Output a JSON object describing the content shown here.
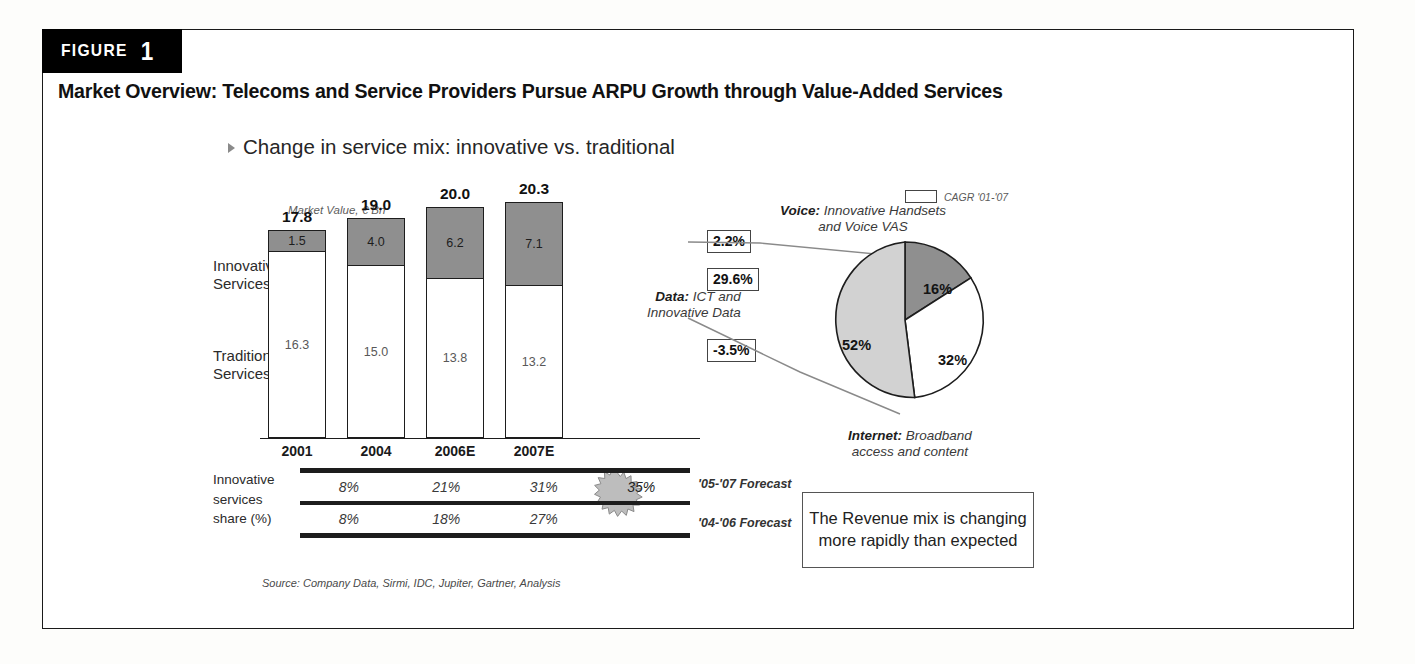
{
  "figure": {
    "tab_word": "FIGURE",
    "tab_number": "1",
    "heading": "Market Overview: Telecoms and Service Providers Pursue ARPU Growth through Value-Added Services",
    "subtitle": "Change in service mix: innovative vs. traditional",
    "source": "Source: Company Data, Sirmi, IDC, Jupiter, Gartner, Analysis"
  },
  "legend": {
    "cagr_label": "CAGR '01-'07",
    "swatch_icon": "rectangle-outline-icon"
  },
  "labels": {
    "axis_caption": "Market Value, € Bn",
    "innovative_services": "Innovative\nServices",
    "innovative_line1": "Innovative",
    "innovative_line2": "Services",
    "traditional_line1": "Traditional",
    "traditional_line2": "Services",
    "share_line1": "Innovative",
    "share_line2": "services",
    "share_line3": "share (%)",
    "forecast_top": "'05-'07 Forecast",
    "forecast_bottom": "'04-'06 Forecast"
  },
  "callout": {
    "text": "The Revenue mix is changing more rapidly than expected"
  },
  "annotations": {
    "voice_bold": "Voice:",
    "voice_rest": " Innovative Handsets",
    "voice_line2": "and Voice VAS",
    "data_bold": "Data:",
    "data_rest": " ICT and",
    "data_line2": "Innovative Data",
    "internet_bold": "Internet:",
    "internet_rest": " Broadband",
    "internet_line2": "access and content"
  },
  "colors": {
    "innovative_segment": "#8f8f8f",
    "traditional_segment": "#ffffff",
    "pie_voice": "#8f8f8f",
    "pie_data": "#d2d2d2",
    "pie_internet": "#ffffff",
    "outline": "#1d1d1d",
    "tab_background": "#000000"
  },
  "chart_data": [
    {
      "type": "bar",
      "title": "Change in service mix: innovative vs. traditional",
      "subtype": "stacked-column",
      "ylabel": "Market Value, € Bn",
      "xlabel": "",
      "categories": [
        "2001",
        "2004",
        "2006E",
        "2007E"
      ],
      "totals": [
        17.8,
        19.0,
        20.0,
        20.3
      ],
      "series": [
        {
          "name": "Innovative Services",
          "values": [
            1.5,
            4.0,
            6.2,
            7.1
          ],
          "color": "#8f8f8f"
        },
        {
          "name": "Traditional Services",
          "values": [
            16.3,
            15.0,
            13.8,
            13.2
          ],
          "color": "#ffffff"
        }
      ],
      "total_labels": [
        "17.8",
        "19.0",
        "20.0",
        "20.3"
      ],
      "innovative_labels": [
        "1.5",
        "4.0",
        "6.2",
        "7.1"
      ],
      "traditional_labels": [
        "16.3",
        "15.0",
        "13.8",
        "13.2"
      ],
      "annotations": [
        {
          "name": "total-cagr",
          "value": "2.2%",
          "series": "Total"
        },
        {
          "name": "innovative-cagr",
          "value": "29.6%",
          "series": "Innovative Services"
        },
        {
          "name": "traditional-cagr",
          "value": "-3.5%",
          "series": "Traditional Services"
        }
      ],
      "ylim": [
        0,
        21
      ],
      "grid": false,
      "legend": "CAGR '01-'07"
    },
    {
      "type": "pie",
      "title": "Innovative services breakdown 2007E",
      "labels": [
        "Voice: Innovative Handsets and Voice VAS",
        "Internet: Broadband access and content",
        "Data: ICT and Innovative Data"
      ],
      "short_labels": [
        "Voice",
        "Internet",
        "Data"
      ],
      "values": [
        16,
        32,
        52
      ],
      "value_labels": [
        "16%",
        "32%",
        "52%"
      ],
      "colors": [
        "#8f8f8f",
        "#ffffff",
        "#d2d2d2"
      ],
      "legend": "bottom"
    },
    {
      "type": "table",
      "title": "Innovative services share (%)",
      "row_header": "Innovative services share (%)",
      "columns": [
        "2001",
        "2004",
        "2006E",
        "2007E"
      ],
      "rows": [
        {
          "name": "'05-'07 Forecast",
          "values": [
            "8%",
            "21%",
            "31%",
            "35%"
          ],
          "highlight_index": 3
        },
        {
          "name": "'04-'06 Forecast",
          "values": [
            "8%",
            "18%",
            "27%",
            ""
          ]
        }
      ]
    }
  ],
  "bar_render": [
    {
      "category": "2001",
      "total": "17.8",
      "inno": "1.5",
      "trad": "16.3",
      "left": 0,
      "inno_h": 22,
      "trad_h": 186
    },
    {
      "category": "2004",
      "total": "19.0",
      "inno": "4.0",
      "trad": "15.0",
      "left": 79,
      "inno_h": 48,
      "trad_h": 172
    },
    {
      "category": "2006E",
      "total": "20.0",
      "inno": "6.2",
      "trad": "13.8",
      "left": 158,
      "inno_h": 72,
      "trad_h": 159
    },
    {
      "category": "2007E",
      "total": "20.3",
      "inno": "7.1",
      "trad": "13.2",
      "left": 237,
      "inno_h": 84,
      "trad_h": 152
    }
  ]
}
